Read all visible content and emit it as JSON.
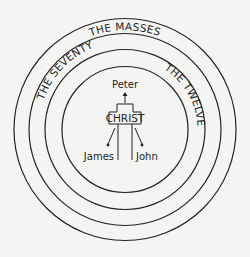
{
  "diagram": {
    "center": "CHRIST",
    "rings": [
      {
        "id": "inner",
        "label": "",
        "radius": 63
      },
      {
        "id": "twelve",
        "label": "THE TWELVE",
        "radius": 80
      },
      {
        "id": "seventy",
        "label": "THE SEVENTY",
        "radius": 96
      },
      {
        "id": "masses",
        "label": "THE MASSES",
        "radius": 111
      }
    ],
    "inner_circle": {
      "top": "Peter",
      "left": "James",
      "right": "John"
    },
    "colors": {
      "ink": "#222222",
      "background": "#f4f4f2"
    }
  }
}
